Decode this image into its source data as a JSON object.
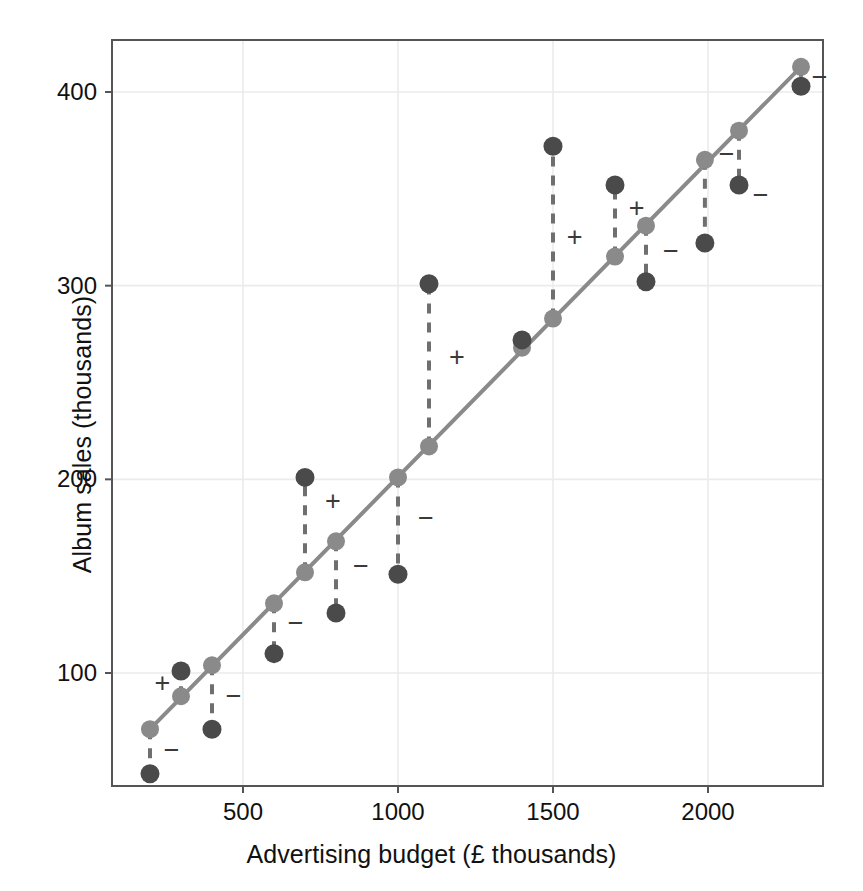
{
  "figure": {
    "background": "#ffffff",
    "panel_border_color": "#555555",
    "grid_color": "#ebebeb",
    "fitted_color": "#8a8a8a",
    "observed_color": "#4a4a4a",
    "residual_line_color": "#6f6f6f",
    "sign_color": "#3a3a3a"
  },
  "chart_data": {
    "type": "scatter",
    "title": "",
    "xlabel": "Advertising budget (£ thousands)",
    "ylabel": "Album sales (thousands)",
    "xlim": [
      120,
      2380
    ],
    "ylim": [
      25,
      432
    ],
    "xticks": [
      500,
      1000,
      1500,
      2000
    ],
    "xtick_labels": [
      "500",
      "1000",
      "1500",
      "2000"
    ],
    "yticks": [
      100,
      200,
      300,
      400
    ],
    "ytick_labels": [
      "100",
      "200",
      "300",
      "400"
    ],
    "grid": true,
    "legend": "none",
    "series": [
      {
        "name": "Observed album sales",
        "marker": "filled-circle",
        "color": "#4a4a4a",
        "x": [
          200,
          300,
          400,
          600,
          700,
          800,
          1000,
          1100,
          1400,
          1500,
          1700,
          1800,
          1990,
          2100,
          2300
        ],
        "values": [
          48,
          101,
          71,
          110,
          201,
          131,
          151,
          301,
          272,
          372,
          352,
          302,
          322,
          352,
          403
        ]
      },
      {
        "name": "Fitted values (regression line)",
        "marker": "filled-circle",
        "color": "#8a8a8a",
        "x": [
          200,
          300,
          400,
          600,
          700,
          800,
          1000,
          1100,
          1400,
          1500,
          1700,
          1800,
          1990,
          2100,
          2300
        ],
        "values": [
          71,
          88,
          104,
          136,
          152,
          168,
          201,
          217,
          268,
          283,
          315,
          331,
          365,
          380,
          413
        ]
      }
    ],
    "regression_line": {
      "color": "#8a8a8a",
      "x_start": 200,
      "y_start": 71,
      "x_end": 2300,
      "y_end": 413
    },
    "residuals": [
      {
        "x": 200,
        "observed": 48,
        "fitted": 71,
        "residual": -23,
        "sign": "−",
        "sign_x": 270,
        "sign_y": 60
      },
      {
        "x": 300,
        "observed": 101,
        "fitted": 88,
        "residual": 13,
        "sign": "+",
        "sign_x": 240,
        "sign_y": 95
      },
      {
        "x": 400,
        "observed": 71,
        "fitted": 104,
        "residual": -33,
        "sign": "−",
        "sign_x": 470,
        "sign_y": 88
      },
      {
        "x": 600,
        "observed": 110,
        "fitted": 136,
        "residual": -26,
        "sign": "−",
        "sign_x": 670,
        "sign_y": 126
      },
      {
        "x": 700,
        "observed": 201,
        "fitted": 152,
        "residual": 49,
        "sign": "+",
        "sign_x": 790,
        "sign_y": 189
      },
      {
        "x": 800,
        "observed": 131,
        "fitted": 168,
        "residual": -37,
        "sign": "−",
        "sign_x": 880,
        "sign_y": 155
      },
      {
        "x": 1000,
        "observed": 151,
        "fitted": 201,
        "residual": -50,
        "sign": "−",
        "sign_x": 1090,
        "sign_y": 180
      },
      {
        "x": 1100,
        "observed": 301,
        "fitted": 217,
        "residual": 84,
        "sign": "+",
        "sign_x": 1190,
        "sign_y": 263
      },
      {
        "x": 1400,
        "observed": 272,
        "fitted": 268,
        "residual": 4,
        "sign": "",
        "sign_x": 0,
        "sign_y": 0
      },
      {
        "x": 1500,
        "observed": 372,
        "fitted": 283,
        "residual": 89,
        "sign": "+",
        "sign_x": 1570,
        "sign_y": 325
      },
      {
        "x": 1700,
        "observed": 352,
        "fitted": 315,
        "residual": 37,
        "sign": "+",
        "sign_x": 1770,
        "sign_y": 340
      },
      {
        "x": 1800,
        "observed": 302,
        "fitted": 331,
        "residual": -29,
        "sign": "−",
        "sign_x": 1880,
        "sign_y": 318
      },
      {
        "x": 1990,
        "observed": 322,
        "fitted": 365,
        "residual": -43,
        "sign": "−",
        "sign_x": 2060,
        "sign_y": 368
      },
      {
        "x": 2100,
        "observed": 352,
        "fitted": 380,
        "residual": -28,
        "sign": "−",
        "sign_x": 2170,
        "sign_y": 347
      },
      {
        "x": 2300,
        "observed": 403,
        "fitted": 413,
        "residual": -10,
        "sign": "−",
        "sign_x": 2360,
        "sign_y": 408
      }
    ]
  }
}
